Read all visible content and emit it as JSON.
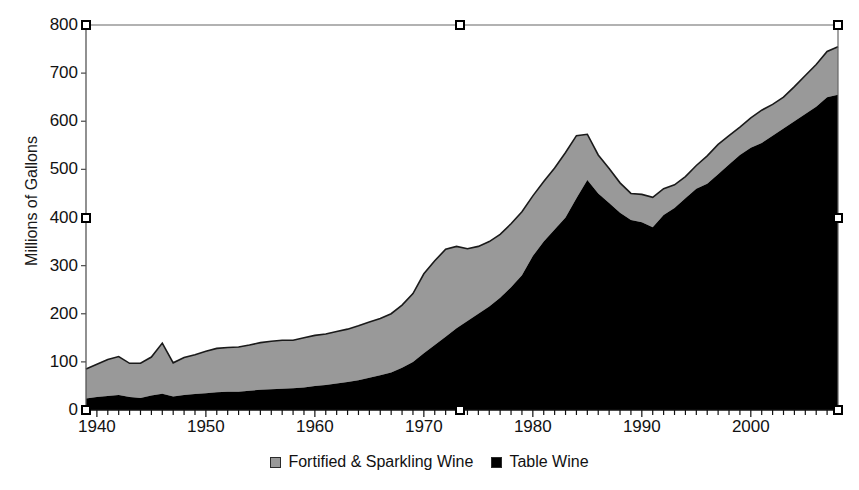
{
  "chart_data": {
    "type": "area",
    "stacked": true,
    "title": "",
    "subtitle": "",
    "xlabel": "",
    "ylabel": "Millions of Gallons",
    "xlim": [
      1939,
      2008
    ],
    "ylim": [
      0,
      800
    ],
    "ytick_step": 100,
    "xtick_step": 1,
    "grid": false,
    "legend_position": "bottom",
    "yticks": [
      "0",
      "100",
      "200",
      "300",
      "400",
      "500",
      "600",
      "700",
      "800"
    ],
    "xticks": [
      "1940",
      "1950",
      "1960",
      "1970",
      "1980",
      "1990",
      "2000"
    ],
    "colors": {
      "fortified_sparkling": "#999999",
      "table_wine": "#000000",
      "outline": "#1a1a1a",
      "axis": "#555555",
      "background": "#ffffff",
      "handle_fill": "#ffffff",
      "handle_stroke": "#000000"
    },
    "x": [
      1939,
      1940,
      1941,
      1942,
      1943,
      1944,
      1945,
      1946,
      1947,
      1948,
      1949,
      1950,
      1951,
      1952,
      1953,
      1954,
      1955,
      1956,
      1957,
      1958,
      1959,
      1960,
      1961,
      1962,
      1963,
      1964,
      1965,
      1966,
      1967,
      1968,
      1969,
      1970,
      1971,
      1972,
      1973,
      1974,
      1975,
      1976,
      1977,
      1978,
      1979,
      1980,
      1981,
      1982,
      1983,
      1984,
      1985,
      1986,
      1987,
      1988,
      1989,
      1990,
      1991,
      1992,
      1993,
      1994,
      1995,
      1996,
      1997,
      1998,
      1999,
      2000,
      2001,
      2002,
      2003,
      2004,
      2005,
      2006,
      2007,
      2008
    ],
    "series": [
      {
        "name": "Table Wine",
        "color": "#000000",
        "values": [
          24,
          27,
          29,
          31,
          27,
          25,
          30,
          34,
          28,
          31,
          33,
          35,
          37,
          38,
          38,
          40,
          42,
          43,
          44,
          45,
          47,
          50,
          52,
          55,
          58,
          62,
          67,
          72,
          78,
          88,
          100,
          118,
          135,
          152,
          170,
          185,
          200,
          215,
          233,
          255,
          280,
          320,
          350,
          375,
          400,
          440,
          478,
          450,
          430,
          410,
          395,
          390,
          380,
          405,
          420,
          440,
          460,
          470,
          490,
          510,
          530,
          545,
          555,
          570,
          585,
          600,
          615,
          630,
          650,
          655
        ]
      },
      {
        "name": "Fortified & Sparkling Wine",
        "color": "#999999",
        "values": [
          61,
          68,
          76,
          80,
          70,
          72,
          80,
          105,
          70,
          78,
          82,
          87,
          91,
          92,
          93,
          95,
          98,
          100,
          101,
          100,
          103,
          105,
          106,
          108,
          110,
          113,
          116,
          118,
          122,
          130,
          142,
          165,
          175,
          182,
          170,
          150,
          140,
          135,
          132,
          132,
          132,
          125,
          125,
          128,
          135,
          130,
          95,
          80,
          72,
          62,
          55,
          58,
          62,
          55,
          48,
          45,
          48,
          58,
          62,
          60,
          58,
          62,
          68,
          65,
          65,
          72,
          80,
          88,
          95,
          100
        ]
      }
    ],
    "total_values": [
      85,
      95,
      105,
      111,
      97,
      97,
      110,
      139,
      98,
      109,
      115,
      122,
      128,
      130,
      131,
      135,
      140,
      143,
      145,
      145,
      150,
      155,
      158,
      163,
      168,
      175,
      183,
      190,
      200,
      218,
      242,
      283,
      310,
      334,
      340,
      335,
      340,
      350,
      365,
      387,
      412,
      445,
      475,
      503,
      535,
      570,
      573,
      530,
      502,
      472,
      450,
      448,
      442,
      460,
      468,
      485,
      508,
      528,
      552,
      570,
      588,
      607,
      623,
      635,
      650,
      672,
      695,
      718,
      745,
      755
    ]
  },
  "legend": {
    "entries": [
      {
        "label": "Fortified & Sparkling Wine",
        "swatch": "#999999"
      },
      {
        "label": "Table Wine",
        "swatch": "#000000"
      }
    ]
  },
  "selection_handles": [
    {
      "name": "handle-top-left",
      "x": 86,
      "y": 25
    },
    {
      "name": "handle-top-center",
      "x": 460,
      "y": 25
    },
    {
      "name": "handle-top-right",
      "x": 838,
      "y": 25
    },
    {
      "name": "handle-mid-left",
      "x": 86,
      "y": 218
    },
    {
      "name": "handle-mid-right",
      "x": 838,
      "y": 218
    },
    {
      "name": "handle-bottom-left",
      "x": 86,
      "y": 410
    },
    {
      "name": "handle-bottom-center",
      "x": 460,
      "y": 410
    },
    {
      "name": "handle-bottom-right",
      "x": 838,
      "y": 410
    }
  ]
}
